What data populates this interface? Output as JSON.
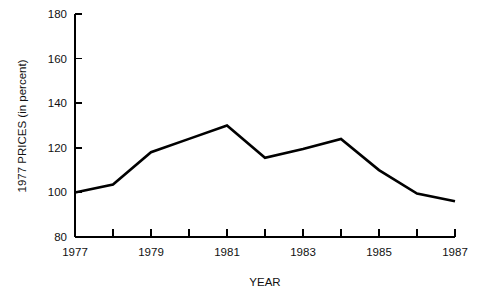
{
  "chart_data": {
    "type": "line",
    "title": "",
    "xlabel": "YEAR",
    "ylabel": "1977 PRICES (in percent)",
    "x": [
      1977,
      1978,
      1979,
      1980,
      1981,
      1982,
      1983,
      1984,
      1985,
      1986,
      1987
    ],
    "values": [
      100,
      103.5,
      118,
      124,
      130,
      115.5,
      119.5,
      124,
      110,
      99.5,
      96
    ],
    "series": [
      {
        "name": "1977 Prices",
        "values": [
          100,
          103.5,
          118,
          124,
          130,
          115.5,
          119.5,
          124,
          110,
          99.5,
          96
        ]
      }
    ],
    "xlim": [
      1977,
      1987
    ],
    "ylim": [
      80,
      180
    ],
    "y_ticks": [
      80,
      100,
      120,
      140,
      160,
      180
    ],
    "y_tick_labels": [
      "80",
      "100",
      "120",
      "140",
      "160",
      "180"
    ],
    "x_ticks": [
      1977,
      1978,
      1979,
      1980,
      1981,
      1982,
      1983,
      1984,
      1985,
      1986,
      1987
    ],
    "x_tick_labels": [
      "1977",
      "",
      "1979",
      "",
      "1981",
      "",
      "1983",
      "",
      "1985",
      "",
      "1987"
    ],
    "x_labeled_ticks": [
      {
        "year": 1977,
        "label": "1977"
      },
      {
        "year": 1979,
        "label": "1979"
      },
      {
        "year": 1981,
        "label": "1981"
      },
      {
        "year": 1983,
        "label": "1983"
      },
      {
        "year": 1985,
        "label": "1985"
      },
      {
        "year": 1987,
        "label": "1987"
      }
    ],
    "grid": false,
    "legend": false,
    "legend_position": "none",
    "line_color": "#000000",
    "background_color": "#ffffff"
  }
}
